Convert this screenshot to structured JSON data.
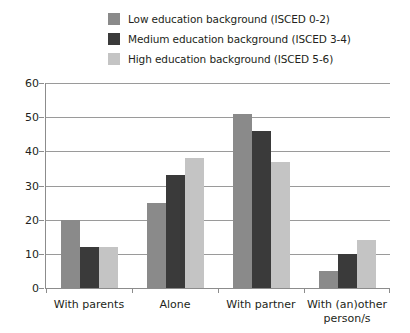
{
  "chart_data": {
    "type": "bar",
    "title": "",
    "subtitle": "",
    "xlabel": "",
    "ylabel": "",
    "ylim": [
      0,
      60
    ],
    "yticks": [
      0,
      10,
      20,
      30,
      40,
      50,
      60
    ],
    "grid": true,
    "legend_position": "top",
    "categories": [
      "With parents",
      "Alone",
      "With partner",
      "With (an)other person/s"
    ],
    "category_lines": [
      [
        "With parents"
      ],
      [
        "Alone"
      ],
      [
        "With partner"
      ],
      [
        "With (an)other",
        "person/s"
      ]
    ],
    "series": [
      {
        "name": "Low education background (ISCED 0-2)",
        "color": "#8a8a8a",
        "values": [
          20,
          25,
          51,
          5
        ]
      },
      {
        "name": "Medium education background (ISCED 3-4)",
        "color": "#3a3a3a",
        "values": [
          12,
          33,
          46,
          10
        ]
      },
      {
        "name": "High education background (ISCED 5-6)",
        "color": "#c4c4c4",
        "values": [
          12,
          38,
          37,
          14
        ]
      }
    ]
  },
  "legend": {
    "items": [
      {
        "label": "Low education background (ISCED 0-2)",
        "color": "#8a8a8a"
      },
      {
        "label": "Medium education background (ISCED 3-4)",
        "color": "#3a3a3a"
      },
      {
        "label": "High education background (ISCED 5-6)",
        "color": "#c4c4c4"
      }
    ]
  },
  "axes": {
    "y_tick_labels": [
      "60",
      "50",
      "40",
      "30",
      "20",
      "10",
      "0"
    ],
    "x_tick_labels": [
      "With parents",
      "Alone",
      "With partner",
      "With (an)other person/s"
    ]
  },
  "colors": {
    "grid": "#9a9a9a",
    "axis": "#8c8c8c",
    "text": "#231f20",
    "background": "#ffffff"
  }
}
